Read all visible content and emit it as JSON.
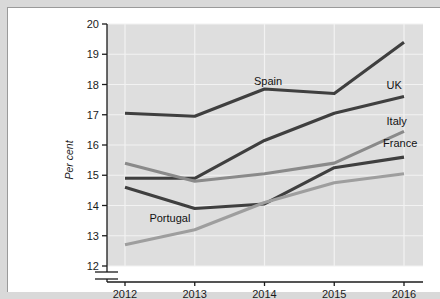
{
  "chart_data": {
    "type": "line",
    "title": "",
    "xlabel": "",
    "ylabel": "Per cent",
    "categories": [
      "2012",
      "2013",
      "2014",
      "2015",
      "2016"
    ],
    "x": [
      2012,
      2013,
      2014,
      2015,
      2016
    ],
    "ylim": [
      12,
      20
    ],
    "yticks": [
      12,
      13,
      14,
      15,
      16,
      17,
      18,
      19,
      20
    ],
    "ytick_labels": [
      "12",
      "13",
      "14",
      "15",
      "16",
      "17",
      "18",
      "19",
      "20"
    ],
    "axis_break": true,
    "grid": true,
    "legend_position": "inline-labels",
    "series": [
      {
        "name": "Spain",
        "color": "#3f3f3f",
        "values": [
          17.05,
          16.95,
          17.85,
          17.7,
          19.4
        ],
        "label_x": 2013.85,
        "label_y": 18.0
      },
      {
        "name": "UK",
        "color": "#3f3f3f",
        "values": [
          14.9,
          14.9,
          16.15,
          17.05,
          17.6
        ],
        "label_x": 2015.75,
        "label_y": 17.85
      },
      {
        "name": "Italy",
        "color": "#8a8a8a",
        "values": [
          15.4,
          14.8,
          15.05,
          15.4,
          16.45
        ],
        "label_x": 2015.75,
        "label_y": 16.65
      },
      {
        "name": "France",
        "color": "#3f3f3f",
        "values": [
          14.6,
          13.9,
          14.05,
          15.25,
          15.6
        ],
        "label_x": 2015.7,
        "label_y": 15.95
      },
      {
        "name": "Portugal",
        "color": "#9e9e9e",
        "values": [
          12.7,
          13.2,
          14.1,
          14.75,
          15.05
        ],
        "label_x": 2012.35,
        "label_y": 13.45
      }
    ],
    "colors": {
      "plot_background": "#dedede",
      "gridline": "#f2f2f2",
      "axis": "#1b1b1b",
      "page_background": "#ffffff",
      "outer_background": "#d9d9d9"
    }
  }
}
